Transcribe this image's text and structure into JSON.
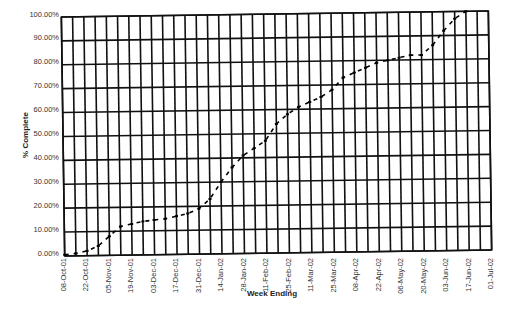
{
  "chart_data": {
    "type": "line",
    "title": "",
    "xlabel": "Week Ending",
    "ylabel": "% Complete",
    "ylim": [
      0,
      100
    ],
    "grid": true,
    "legend": null,
    "y_ticks": [
      "0.00%",
      "10.00%",
      "20.00%",
      "30.00%",
      "40.00%",
      "50.00%",
      "60.00%",
      "70.00%",
      "80.00%",
      "90.00%",
      "100.00%"
    ],
    "x_tick_labels": [
      "08-Oct-01",
      "22-Oct-01",
      "05-Nov-01",
      "19-Nov-01",
      "03-Dec-01",
      "17-Dec-01",
      "31-Dec-01",
      "14-Jan-02",
      "28-Jan-02",
      "11-Feb-02",
      "25-Feb-02",
      "11-Mar-02",
      "25-Mar-02",
      "08-Apr-02",
      "22-Apr-02",
      "06-May-02",
      "20-May-02",
      "03-Jun-02",
      "17-Jun-02",
      "01-Jul-02"
    ],
    "x": [
      "08-Oct-01",
      "15-Oct-01",
      "22-Oct-01",
      "29-Oct-01",
      "05-Nov-01",
      "12-Nov-01",
      "19-Nov-01",
      "26-Nov-01",
      "03-Dec-01",
      "10-Dec-01",
      "17-Dec-01",
      "24-Dec-01",
      "31-Dec-01",
      "07-Jan-02",
      "14-Jan-02",
      "21-Jan-02",
      "28-Jan-02",
      "04-Feb-02",
      "11-Feb-02",
      "18-Feb-02",
      "25-Feb-02",
      "04-Mar-02",
      "11-Mar-02",
      "18-Mar-02",
      "25-Mar-02",
      "01-Apr-02",
      "08-Apr-02",
      "15-Apr-02",
      "22-Apr-02",
      "29-Apr-02",
      "06-May-02",
      "13-May-02",
      "20-May-02",
      "27-May-02",
      "03-Jun-02",
      "10-Jun-02",
      "17-Jun-02",
      "24-Jun-02",
      "01-Jul-02"
    ],
    "series": [
      {
        "name": "% Complete",
        "style": "dashed",
        "color": "#000000",
        "values": [
          0.5,
          1,
          2,
          4,
          8,
          12,
          13,
          14,
          14.5,
          15,
          16,
          17,
          19,
          23,
          30,
          36,
          41,
          44,
          47,
          54,
          58,
          61,
          63,
          65,
          68,
          73,
          75,
          77,
          79,
          80,
          81,
          82,
          82,
          86,
          92,
          97,
          100,
          null,
          null
        ]
      }
    ]
  }
}
